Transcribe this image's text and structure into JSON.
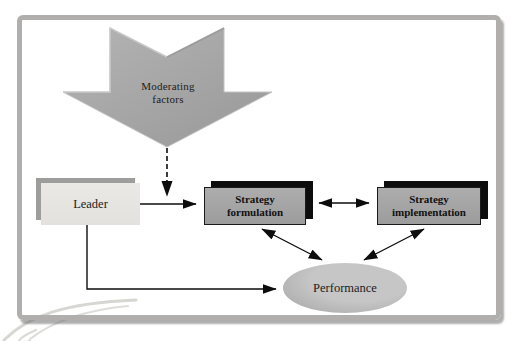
{
  "diagram": {
    "type": "flow-diagram",
    "nodes": [
      {
        "id": "moderating-factors",
        "shape": "down-chevron-arrow",
        "label": "Moderating factors"
      },
      {
        "id": "leader",
        "shape": "rectangle",
        "label": "Leader"
      },
      {
        "id": "strategy-formulation",
        "shape": "rectangle",
        "label": "Strategy formulation"
      },
      {
        "id": "strategy-implementation",
        "shape": "rectangle",
        "label": "Strategy implementation"
      },
      {
        "id": "performance",
        "shape": "ellipse",
        "label": "Performance"
      }
    ],
    "edges": [
      {
        "from": "leader",
        "to": "strategy-formulation",
        "style": "solid",
        "heads": "end"
      },
      {
        "from": "moderating-factors",
        "to": "leader-formulation-arrow",
        "style": "dashed",
        "heads": "end"
      },
      {
        "from": "strategy-formulation",
        "to": "strategy-implementation",
        "style": "solid",
        "heads": "both"
      },
      {
        "from": "strategy-formulation",
        "to": "performance",
        "style": "solid",
        "heads": "both"
      },
      {
        "from": "strategy-implementation",
        "to": "performance",
        "style": "solid",
        "heads": "both"
      },
      {
        "from": "leader",
        "to": "performance",
        "style": "solid-elbow",
        "heads": "end"
      }
    ],
    "colors": {
      "chevron_arrow_fill": "#a6a6a6",
      "gray_box_fill": "#a5a5a5",
      "gray_box_shadow": "#0d0d0d",
      "leader_box_fill": "#e5e4e1",
      "leader_box_shadow": "#9d9d9b",
      "ellipse_fill": "#b9b9b9",
      "frame_border": "#b0afad",
      "connector": "#111111",
      "background": "#ffffff"
    }
  }
}
